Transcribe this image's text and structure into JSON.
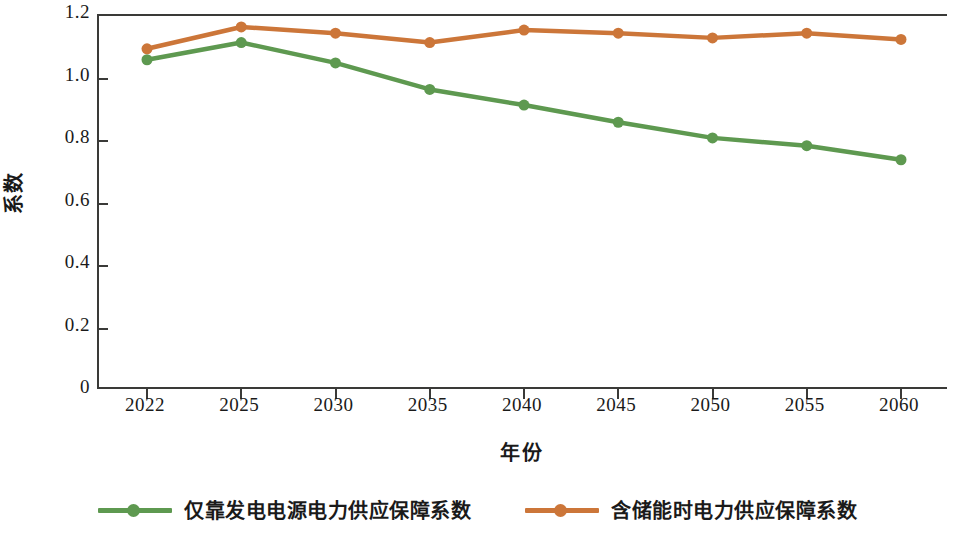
{
  "chart_data": {
    "type": "line",
    "title": "",
    "xlabel": "年份",
    "ylabel": "系数",
    "categories": [
      "2022",
      "2025",
      "2030",
      "2035",
      "2040",
      "2045",
      "2050",
      "2055",
      "2060"
    ],
    "series": [
      {
        "name": "仅靠发电电源电力供应保障系数",
        "color": "#5E9950",
        "marker": "circle",
        "values": [
          1.06,
          1.115,
          1.05,
          0.965,
          0.915,
          0.86,
          0.81,
          0.785,
          0.74
        ]
      },
      {
        "name": "含储能时电力供应保障系数",
        "color": "#CC7639",
        "marker": "circle",
        "values": [
          1.095,
          1.165,
          1.145,
          1.115,
          1.155,
          1.145,
          1.13,
          1.145,
          1.125
        ]
      }
    ],
    "ylim": [
      0,
      1.2
    ],
    "y_ticks": [
      "1.2",
      "1.0",
      "0.8",
      "0.6",
      "0.4",
      "0.2",
      "0"
    ],
    "y_tick_values": [
      1.2,
      1.0,
      0.8,
      0.6,
      0.4,
      0.2,
      0
    ],
    "grid": false,
    "legend_position": "bottom"
  },
  "legend": {
    "items": [
      {
        "label": "仅靠发电电源电力供应保障系数",
        "color": "#5E9950"
      },
      {
        "label": "含储能时电力供应保障系数",
        "color": "#CC7639"
      }
    ]
  },
  "axes": {
    "y_title": "系数",
    "x_title": "年份"
  },
  "colors": {
    "axis": "#3a3a38",
    "text": "#1a1a1a",
    "background": "#ffffff",
    "series_green": "#5E9950",
    "series_orange": "#CC7639"
  }
}
